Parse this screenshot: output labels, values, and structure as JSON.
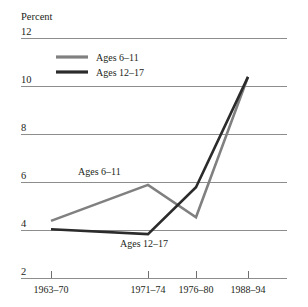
{
  "chart_data": {
    "type": "line",
    "title": "",
    "subtitle": "",
    "xlabel": "",
    "ylabel": "Percent",
    "categories": [
      "1963–70",
      "1971–74",
      "1976–80",
      "1988–94"
    ],
    "series": [
      {
        "name": "Ages 6–11",
        "values": [
          4.4,
          5.9,
          4.55,
          10.4
        ],
        "color": "#808080"
      },
      {
        "name": "Ages 12–17",
        "values": [
          4.05,
          3.85,
          5.8,
          10.4
        ],
        "color": "#2b2b2b"
      }
    ],
    "ylim": [
      2,
      12
    ],
    "yticks": [
      12,
      10,
      8,
      6,
      4,
      2
    ],
    "ytick_labels": [
      "12",
      "10",
      "8",
      "6",
      "4",
      "2"
    ],
    "grid": true,
    "grid_axis": "y",
    "legend_position": "inside-top-left",
    "annotations": [
      {
        "text": "Ages 6–11",
        "series": "Ages 6–11",
        "x": 78,
        "y": 175
      },
      {
        "text": "Ages 12–17",
        "series": "Ages 12–17",
        "x": 120,
        "y": 247
      }
    ]
  },
  "axis": {
    "unit_label": "Percent",
    "ytick_0": "12",
    "ytick_1": "10",
    "ytick_2": "8",
    "ytick_3": "6",
    "ytick_4": "4",
    "ytick_5": "2",
    "xtick_0": "1963–70",
    "xtick_1": "1971–74",
    "xtick_2": "1976–80",
    "xtick_3": "1988–94"
  },
  "legend": {
    "entry_0_label": "Ages 6–11",
    "entry_1_label": "Ages 12–17"
  },
  "annotations": {
    "label_upper": "Ages 6–11",
    "label_lower": "Ages 12–17"
  },
  "colors": {
    "series_ages_6_11": "#808080",
    "series_ages_12_17": "#2b2b2b",
    "gridline": "#8d8d8d",
    "text": "#231f20",
    "background": "#ffffff"
  }
}
